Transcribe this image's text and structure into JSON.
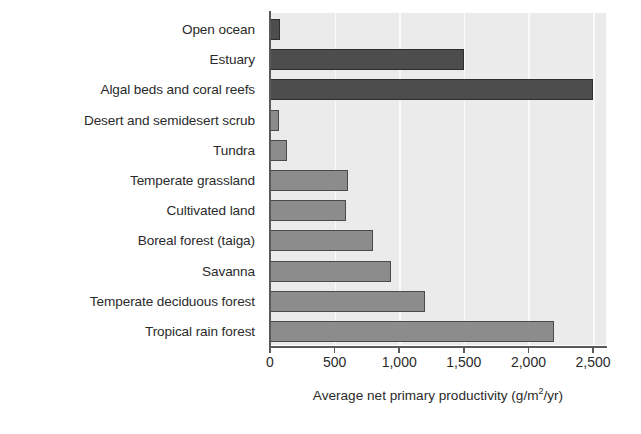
{
  "chart_data": {
    "type": "bar",
    "orientation": "horizontal",
    "title": "",
    "xlabel": "Average net primary productivity (g/m2/yr)",
    "xlabel_parts": {
      "before": "Average net primary productivity (g/m",
      "sup": "2",
      "after": "/yr)"
    },
    "ylabel": "",
    "xlim": [
      0,
      2600
    ],
    "xticks": [
      0,
      500,
      1000,
      1500,
      2000,
      2500
    ],
    "xtick_labels": [
      "0",
      "500",
      "1,000",
      "1,500",
      "2,000",
      "2,500"
    ],
    "grid": true,
    "legend": "none",
    "categories": [
      "Open ocean",
      "Estuary",
      "Algal beds and coral reefs",
      "Desert and semidesert scrub",
      "Tundra",
      "Temperate grassland",
      "Cultivated land",
      "Boreal forest (taiga)",
      "Savanna",
      "Temperate deciduous forest",
      "Tropical rain forest"
    ],
    "values": [
      75,
      1500,
      2500,
      70,
      130,
      600,
      590,
      800,
      940,
      1200,
      2200
    ],
    "bar_shades": [
      "dark",
      "dark",
      "dark",
      "light",
      "light",
      "light",
      "light",
      "light",
      "light",
      "light",
      "light"
    ],
    "colors": {
      "bar_dark": "#4d4d4d",
      "bar_light": "#8c8c8c",
      "bar_outline": "#3a3a3a",
      "plot_background": "#ebebeb",
      "gridline": "#fafafa",
      "axis": "#5a5a5a",
      "text": "#2b2b2b",
      "page_background": "#ffffff"
    }
  }
}
